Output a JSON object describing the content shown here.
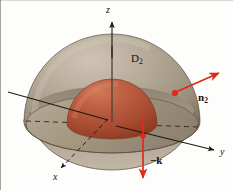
{
  "figure": {
    "background": "#fdfdfc",
    "labels": {
      "z_axis": "z",
      "y_axis": "y",
      "x_axis": "x",
      "region": "D",
      "region_sub": "2",
      "normal_vector": "n",
      "normal_vector_sub": "2",
      "k_vector": "−k"
    },
    "colors": {
      "outer_shell_light": "#b3a796",
      "outer_shell_mid": "#9c8f7e",
      "outer_shell_dark": "#6d6052",
      "inner_dome_light": "#c2684a",
      "inner_dome_mid": "#ab4f33",
      "inner_dome_dark": "#8d3c24",
      "disk_base": "#a79a89",
      "arrow_red": "#e02a18",
      "axis_black": "#1d1916",
      "text_black": "#16120f"
    },
    "geometry": {
      "origin": {
        "x": 112,
        "y": 122
      },
      "outer_radius": 88,
      "inner_radius": 45,
      "z_axis_top": {
        "x": 112,
        "y": 24
      },
      "y_axis_end": {
        "x": 218,
        "y": 152
      },
      "y_axis_start": {
        "x": 8,
        "y": 92
      },
      "x_axis_end": {
        "x": 57,
        "y": 172
      },
      "normal_arrow_start": {
        "x": 175,
        "y": 92
      },
      "normal_arrow_end": {
        "x": 222,
        "y": 72
      },
      "k_arrow_start": {
        "x": 143,
        "y": 137
      },
      "k_arrow_end": {
        "x": 143,
        "y": 182
      }
    }
  }
}
